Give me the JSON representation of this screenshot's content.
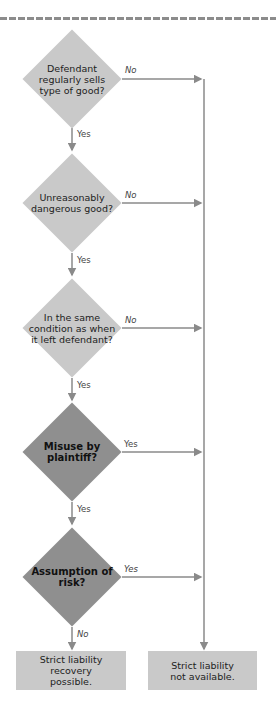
{
  "diagram": {
    "type": "flowchart",
    "colors": {
      "light_decision": "#c9c9c9",
      "dark_decision": "#8f8f8f",
      "outcome_box": "#c9c9c9",
      "line": "#8a8a8a",
      "dashed_rule": "#8c8c8c"
    },
    "decisions": [
      {
        "id": "d1",
        "text": "Defendant regularly sells type of good?",
        "lines": [
          "Defendant",
          "regularly sells",
          "type of good?"
        ],
        "style": "light",
        "side_label": "No",
        "down_label": "Yes"
      },
      {
        "id": "d2",
        "text": "Unreasonably dangerous good?",
        "lines": [
          "Unreasonably",
          "dangerous",
          "good?"
        ],
        "style": "light",
        "side_label": "No",
        "down_label": "Yes"
      },
      {
        "id": "d3",
        "text": "In the same condition as when it left defendant?",
        "lines": [
          "In the same",
          "condition",
          "as when it left",
          "defendant?"
        ],
        "style": "light",
        "side_label": "No",
        "down_label": "Yes"
      },
      {
        "id": "d4",
        "text": "Misuse by plaintiff?",
        "lines": [
          "Misuse",
          "by",
          "plaintiff?"
        ],
        "style": "dark",
        "side_label": "Yes",
        "down_label": "Yes"
      },
      {
        "id": "d5",
        "text": "Assumption of risk?",
        "lines": [
          "Assumption",
          "of risk?"
        ],
        "style": "dark",
        "side_label": "Yes",
        "down_label": "No"
      }
    ],
    "outcomes": [
      {
        "id": "o1",
        "text": "Strict liability recovery possible.",
        "lines": [
          "Strict liability",
          "recovery possible."
        ]
      },
      {
        "id": "o2",
        "text": "Strict liability not available.",
        "lines": [
          "Strict liability",
          "not available."
        ]
      }
    ]
  }
}
